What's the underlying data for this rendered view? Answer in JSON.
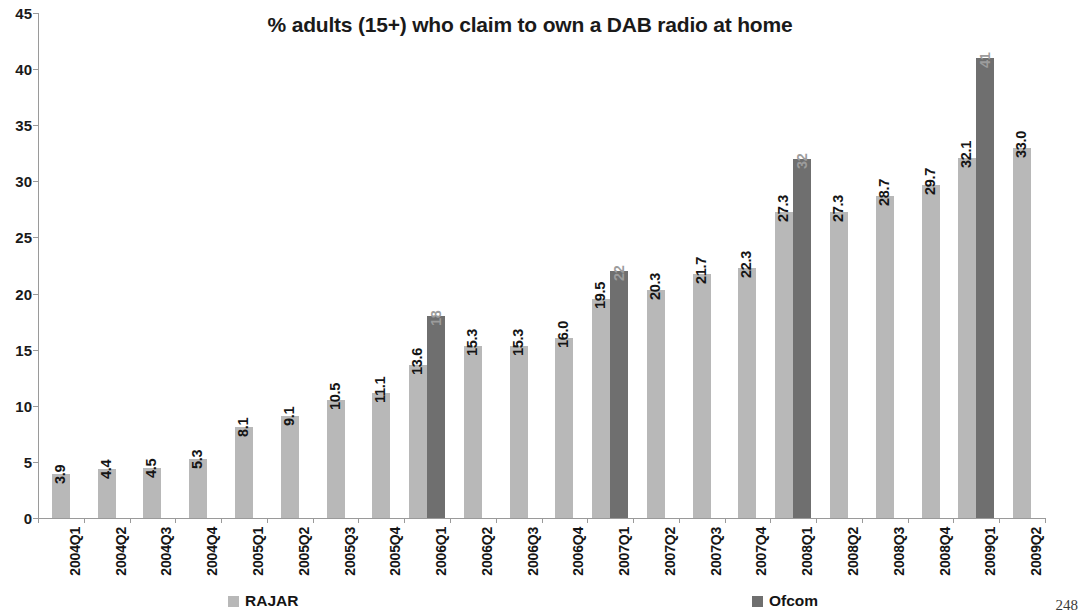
{
  "page_number": "248",
  "legend": {
    "rajar_label": "RAJAR",
    "ofcom_label": "Ofcom",
    "rajar_color": "#b8b8b8",
    "ofcom_color": "#6f6f6f"
  },
  "chart_data": {
    "type": "bar",
    "title": "% adults (15+) who claim to own a DAB radio at home",
    "xlabel": "",
    "ylabel": "",
    "ylim": [
      0,
      45
    ],
    "yticks": [
      0,
      5,
      10,
      15,
      20,
      25,
      30,
      35,
      40,
      45
    ],
    "grid": false,
    "legend_position": "bottom",
    "categories": [
      "2004Q1",
      "2004Q2",
      "2004Q3",
      "2004Q4",
      "2005Q1",
      "2005Q2",
      "2005Q3",
      "2005Q4",
      "2006Q1",
      "2006Q2",
      "2006Q3",
      "2006Q4",
      "2007Q1",
      "2007Q2",
      "2007Q3",
      "2007Q4",
      "2008Q1",
      "2008Q2",
      "2008Q3",
      "2008Q4",
      "2009Q1",
      "2009Q2"
    ],
    "series": [
      {
        "name": "RAJAR",
        "color": "#b8b8b8",
        "values": [
          3.9,
          4.4,
          4.5,
          5.3,
          8.1,
          9.1,
          10.5,
          11.1,
          13.6,
          15.3,
          15.3,
          16.0,
          19.5,
          20.3,
          21.7,
          22.3,
          27.3,
          27.3,
          28.7,
          29.7,
          32.1,
          33.0
        ],
        "labels": [
          "3.9",
          "4.4",
          "4.5",
          "5.3",
          "8.1",
          "9.1",
          "10.5",
          "11.1",
          "13.6",
          "15.3",
          "15.3",
          "16.0",
          "19.5",
          "20.3",
          "21.7",
          "22.3",
          "27.3",
          "27.3",
          "28.7",
          "29.7",
          "32.1",
          "33.0"
        ]
      },
      {
        "name": "Ofcom",
        "color": "#6f6f6f",
        "values": [
          null,
          null,
          null,
          null,
          null,
          null,
          null,
          null,
          18,
          null,
          null,
          null,
          22,
          null,
          null,
          null,
          32,
          null,
          null,
          null,
          41,
          null
        ],
        "labels": [
          "",
          "",
          "",
          "",
          "",
          "",
          "",
          "",
          "18",
          "",
          "",
          "",
          "22",
          "",
          "",
          "",
          "32",
          "",
          "",
          "",
          "41",
          ""
        ]
      }
    ]
  }
}
